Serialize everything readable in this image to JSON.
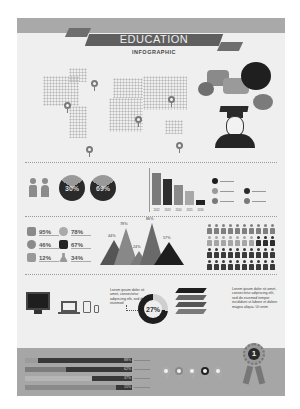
{
  "header": {
    "title": "EDUCATION",
    "subtitle": "INFOGRAPHIC"
  },
  "colors": {
    "background": "#efefef",
    "band": "#a9a9a9",
    "ribbon": "#5f5f5f",
    "dark": "#2e2e2e",
    "mid": "#7f7f7f",
    "light": "#a8a8a8"
  },
  "map": {
    "pins": 6,
    "icon": "location-pin-icon"
  },
  "graduate": {
    "icon": "graduate-with-speech-bubbles-icon"
  },
  "gender": {
    "male_icon": "male-icon",
    "female_icon": "female-icon"
  },
  "pies": [
    {
      "label": "30%",
      "value": 30
    },
    {
      "label": "69%",
      "value": 69
    }
  ],
  "stats": [
    {
      "icon": "book-icon",
      "value": "95%"
    },
    {
      "icon": "lightbulb-icon",
      "value": "78%"
    },
    {
      "icon": "globe-icon",
      "value": "46%"
    },
    {
      "icon": "ruler-icon",
      "value": "67%"
    },
    {
      "icon": "music-note-icon",
      "value": "12%"
    },
    {
      "icon": "flask-icon",
      "value": "34%"
    }
  ],
  "mountains": [
    {
      "label": "44%",
      "value": 44
    },
    {
      "label": "78%",
      "value": 78
    },
    {
      "label": "24%",
      "value": 24
    },
    {
      "label": "86%",
      "value": 86
    },
    {
      "label": "57%",
      "value": 57
    }
  ],
  "donut": {
    "label": "27%",
    "value": 27,
    "caption": "Lorem ipsum dolor sit amet, consectetur adipiscing elit, sed do eiusmod"
  },
  "books": {
    "caption": "Lorem ipsum dolor sit amet, consectetur adipiscing elit, sed do eiusmod tempor incididunt ut labore et dolore magna aliqua. Ut enim"
  },
  "devices": [
    "monitor-icon",
    "laptop-icon",
    "tablet-icon",
    "phone-icon"
  ],
  "progress": [
    {
      "label": "88%",
      "value": 88
    },
    {
      "label": "62%",
      "value": 62
    },
    {
      "label": "37%",
      "value": 37
    },
    {
      "label": "15%",
      "value": 15
    }
  ],
  "award": {
    "label": "1",
    "icon": "award-ribbon-icon"
  },
  "chart_data": [
    {
      "type": "pie",
      "title": "",
      "values": [
        30,
        69
      ],
      "categories": [
        "Male",
        "Female"
      ]
    },
    {
      "type": "bar",
      "title": "",
      "categories": [
        "2012",
        "2013",
        "2014",
        "2015",
        "2016"
      ],
      "values": [
        90,
        75,
        60,
        45,
        20
      ],
      "xlabel": "",
      "ylabel": ""
    },
    {
      "type": "area",
      "title": "",
      "categories": [
        "A",
        "B",
        "C",
        "D",
        "E"
      ],
      "values": [
        44,
        78,
        24,
        86,
        57
      ]
    },
    {
      "type": "bar",
      "title": "",
      "orientation": "horizontal",
      "categories": [
        "1",
        "2",
        "3",
        "4"
      ],
      "values": [
        88,
        62,
        37,
        15
      ]
    }
  ]
}
